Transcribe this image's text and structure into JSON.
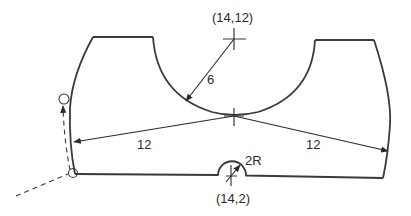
{
  "diagram": {
    "type": "cnc-toolpath-part-profile",
    "stroke_color": "#3a3a3a",
    "labels": {
      "upper_center": "(14,12)",
      "lower_center": "(14,2)",
      "upper_arc_radius": "6",
      "left_sweep_radius": "12",
      "right_sweep_radius": "12",
      "notch_radius": "2R"
    },
    "elements": [
      {
        "name": "top-left-edge",
        "desc": "straight top edge of left boss"
      },
      {
        "name": "top-right-edge",
        "desc": "straight top edge of right boss"
      },
      {
        "name": "center-concave-arc",
        "desc": "R6 arc centered at (14,12)"
      },
      {
        "name": "left-convex-side",
        "desc": "R12 arc side"
      },
      {
        "name": "right-convex-side",
        "desc": "R12 arc side"
      },
      {
        "name": "bottom-edge",
        "desc": "bottom line with R2 semicircular notch at (14,2)"
      },
      {
        "name": "tool-approach-path",
        "desc": "dashed lead-in with tool circles"
      }
    ]
  }
}
